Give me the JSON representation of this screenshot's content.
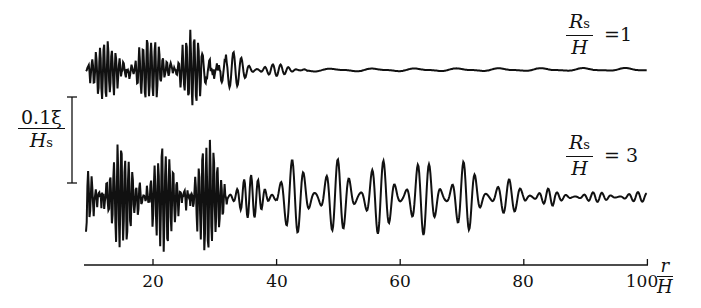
{
  "chart_data": {
    "type": "line",
    "title": "",
    "xlabel": "r/H",
    "ylabel": "0.1 ξ / H_s (scale bar)",
    "xlim": [
      10,
      100
    ],
    "x_ticks": [
      20,
      40,
      60,
      80,
      100
    ],
    "grid": false,
    "series": [
      {
        "name": "Rs/H = 1",
        "label_ratio": "1",
        "description": "Wave record; large high-frequency oscillations for r/H 10–30 (peak near r/H≈24), decaying to near-flat by r/H≈45 and nearly flat to 100."
      },
      {
        "name": "Rs/H = 3",
        "label_ratio": "3",
        "description": "Wave record; dense high-frequency oscillations for r/H 10–32, then lower-frequency large oscillations peaking near r/H≈50–65, decaying gradually to small ripples by r/H≈100."
      }
    ],
    "scale_bar": {
      "label_num": "0.1ξ",
      "label_den": "H",
      "label_den_sub": "s"
    }
  },
  "axis": {
    "ticks": [
      "20",
      "40",
      "60",
      "80",
      "100"
    ],
    "label_num": "r",
    "label_den": "H"
  },
  "legend": {
    "top": {
      "num": "R",
      "num_sub": "s",
      "den": "H",
      "eq": "=1"
    },
    "bottom": {
      "num": "R",
      "num_sub": "s",
      "den": "H",
      "eq": "= 3"
    }
  },
  "colors": {
    "line": "#111111",
    "background": "#ffffff"
  }
}
